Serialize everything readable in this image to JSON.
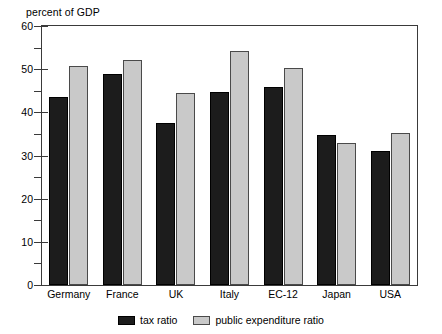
{
  "chart_data": {
    "type": "bar",
    "title": "",
    "ylabel": "percent of GDP",
    "xlabel": "",
    "ylim": [
      0,
      60
    ],
    "ytick_step": 10,
    "yminor_step": 5,
    "grid": false,
    "legend_position": "bottom-center",
    "ytick_labels": [
      "60",
      "50",
      "40",
      "30",
      "20",
      "10",
      "0"
    ],
    "ytick_values": [
      60,
      50,
      40,
      30,
      20,
      10,
      0
    ],
    "yminor_values": [
      55,
      45,
      35,
      25,
      15,
      5
    ],
    "categories": [
      "Germany",
      "France",
      "UK",
      "Italy",
      "EC-12",
      "Japan",
      "USA"
    ],
    "series": [
      {
        "name": "tax ratio",
        "color": "#1c1c1c",
        "values": [
          43.5,
          48.8,
          37.6,
          44.6,
          45.8,
          34.7,
          31.0
        ]
      },
      {
        "name": "public expenditure ratio",
        "color": "#c9c9c9",
        "values": [
          50.7,
          52.2,
          44.4,
          54.3,
          50.2,
          33.0,
          35.2
        ]
      }
    ]
  }
}
